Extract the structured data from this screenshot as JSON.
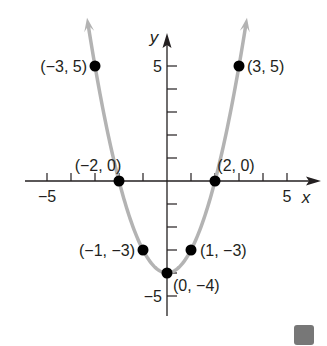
{
  "chart_data": {
    "type": "line",
    "title": "",
    "xlabel": "x",
    "ylabel": "y",
    "xlim": [
      -5.5,
      5.5
    ],
    "ylim": [
      -6,
      6
    ],
    "grid": false,
    "function": "y = x^2 - 4",
    "x_ticks": [
      -5,
      -4,
      -3,
      -2,
      -1,
      1,
      2,
      3,
      4,
      5
    ],
    "y_ticks": [
      -5,
      -4,
      -3,
      -2,
      -1,
      1,
      2,
      3,
      4,
      5
    ],
    "x_tick_labels": [
      {
        "value": -5,
        "label": "−5"
      },
      {
        "value": 5,
        "label": "5"
      }
    ],
    "y_tick_labels": [
      {
        "value": 5,
        "label": "5"
      },
      {
        "value": -5,
        "label": "−5"
      }
    ],
    "series": [
      {
        "name": "parabola",
        "color": "#b3b3b3",
        "points": [
          {
            "x": -3,
            "y": 5,
            "label": "(−3, 5)"
          },
          {
            "x": -2,
            "y": 0,
            "label": "(−2, 0)"
          },
          {
            "x": -1,
            "y": -3,
            "label": "(−1, −3)"
          },
          {
            "x": 0,
            "y": -4,
            "label": "(0, −4)"
          },
          {
            "x": 1,
            "y": -3,
            "label": "(1, −3)"
          },
          {
            "x": 2,
            "y": 0,
            "label": "(2, 0)"
          },
          {
            "x": 3,
            "y": 5,
            "label": "(3, 5)"
          }
        ]
      }
    ]
  },
  "colors": {
    "axis": "#231f20",
    "curve": "#b3b3b3",
    "point": "#000000"
  }
}
